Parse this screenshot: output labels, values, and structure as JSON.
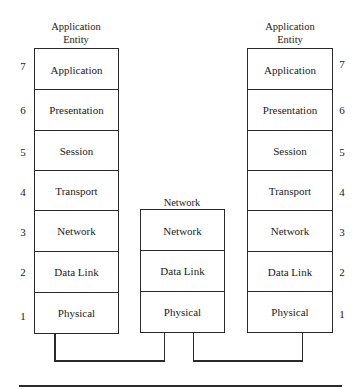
{
  "diagram": {
    "type": "osi-reference-model-relay",
    "left_stack": {
      "caption_line1": "Application",
      "caption_line2": "Entity",
      "layers": [
        "Application",
        "Presentation",
        "Session",
        "Transport",
        "Network",
        "Data Link",
        "Physical"
      ]
    },
    "middle_stack": {
      "caption": "Network",
      "layers": [
        "Network",
        "Data Link",
        "Physical"
      ]
    },
    "right_stack": {
      "caption_line1": "Application",
      "caption_line2": "Entity",
      "layers": [
        "Application",
        "Presentation",
        "Session",
        "Transport",
        "Network",
        "Data Link",
        "Physical"
      ]
    },
    "layer_numbers": [
      "7",
      "6",
      "5",
      "4",
      "3",
      "2",
      "1"
    ],
    "connections": [
      {
        "from": "left_stack.Physical",
        "to": "middle_stack.Physical"
      },
      {
        "from": "middle_stack.Physical",
        "to": "right_stack.Physical"
      }
    ]
  }
}
